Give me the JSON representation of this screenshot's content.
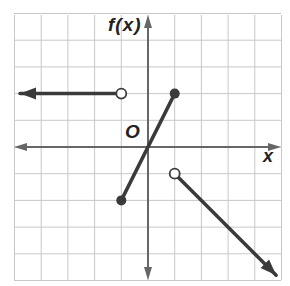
{
  "chart_data": {
    "type": "line",
    "title": "",
    "xlabel": "x",
    "ylabel": "f(x)",
    "origin_label": "O",
    "xlim": [
      -5,
      5
    ],
    "ylim": [
      -5,
      5
    ],
    "grid": true,
    "grid_step": 1,
    "series": [
      {
        "name": "piece-1",
        "description": "constant ray y = 2 for x < -1",
        "points": [
          [
            -5,
            2
          ],
          [
            -1,
            2
          ]
        ],
        "start": {
          "x": -5,
          "y": 2,
          "marker": "arrow-left"
        },
        "end": {
          "x": -1,
          "y": 2,
          "marker": "open-circle"
        }
      },
      {
        "name": "piece-2",
        "description": "segment y = 2x for -1 <= x <= 1",
        "points": [
          [
            -1,
            -2
          ],
          [
            1,
            2
          ]
        ],
        "start": {
          "x": -1,
          "y": -2,
          "marker": "closed-circle"
        },
        "end": {
          "x": 1,
          "y": 2,
          "marker": "closed-circle"
        }
      },
      {
        "name": "piece-3",
        "description": "ray y = -x for x > 1",
        "points": [
          [
            1,
            -1
          ],
          [
            4.8,
            -4.8
          ]
        ],
        "start": {
          "x": 1,
          "y": -1,
          "marker": "open-circle"
        },
        "end": {
          "x": 4.8,
          "y": -4.8,
          "marker": "arrow-down-right"
        }
      }
    ],
    "colors": {
      "grid": "#c8c8c8",
      "axis": "#666666",
      "curve": "#3a3a3a"
    }
  }
}
